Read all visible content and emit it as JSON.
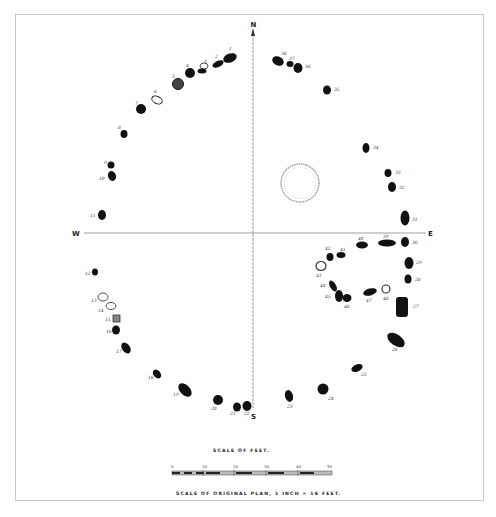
{
  "diagram": {
    "compass": {
      "north": "N",
      "south": "S",
      "east": "E",
      "west": "W"
    },
    "center_feature": "central-ring",
    "stones": [
      {
        "id": "1",
        "x": 230,
        "y": 58
      },
      {
        "id": "2",
        "x": 218,
        "y": 64
      },
      {
        "id": "3",
        "x": 202,
        "y": 70
      },
      {
        "id": "4",
        "x": 190,
        "y": 73
      },
      {
        "id": "5",
        "x": 178,
        "y": 84
      },
      {
        "id": "6",
        "x": 157,
        "y": 100
      },
      {
        "id": "7",
        "x": 141,
        "y": 109
      },
      {
        "id": "8",
        "x": 124,
        "y": 133
      },
      {
        "id": "9",
        "x": 111,
        "y": 164
      },
      {
        "id": "10",
        "x": 112,
        "y": 176
      },
      {
        "id": "11",
        "x": 102,
        "y": 215
      },
      {
        "id": "12",
        "x": 95,
        "y": 272
      },
      {
        "id": "13",
        "x": 98,
        "y": 305
      },
      {
        "id": "14",
        "x": 108,
        "y": 311
      },
      {
        "id": "15",
        "x": 116,
        "y": 318
      },
      {
        "id": "16",
        "x": 116,
        "y": 330
      },
      {
        "id": "17",
        "x": 126,
        "y": 348
      },
      {
        "id": "18",
        "x": 157,
        "y": 374
      },
      {
        "id": "19",
        "x": 185,
        "y": 390
      },
      {
        "id": "20",
        "x": 217,
        "y": 400
      },
      {
        "id": "21",
        "x": 237,
        "y": 407
      },
      {
        "id": "22",
        "x": 247,
        "y": 406
      },
      {
        "id": "23",
        "x": 289,
        "y": 396
      },
      {
        "id": "24",
        "x": 323,
        "y": 389
      },
      {
        "id": "25",
        "x": 357,
        "y": 368
      },
      {
        "id": "26",
        "x": 395,
        "y": 340
      },
      {
        "id": "27",
        "x": 402,
        "y": 307
      },
      {
        "id": "28",
        "x": 409,
        "y": 278
      },
      {
        "id": "29",
        "x": 410,
        "y": 262
      },
      {
        "id": "30",
        "x": 405,
        "y": 242
      },
      {
        "id": "31",
        "x": 405,
        "y": 218
      },
      {
        "id": "32",
        "x": 391,
        "y": 187
      },
      {
        "id": "33",
        "x": 387,
        "y": 173
      },
      {
        "id": "34",
        "x": 366,
        "y": 148
      },
      {
        "id": "35",
        "x": 327,
        "y": 90
      },
      {
        "id": "36",
        "x": 297,
        "y": 67
      },
      {
        "id": "37",
        "x": 289,
        "y": 63
      },
      {
        "id": "38",
        "x": 278,
        "y": 60
      },
      {
        "id": "39",
        "x": 385,
        "y": 243
      },
      {
        "id": "40",
        "x": 361,
        "y": 244
      },
      {
        "id": "41",
        "x": 341,
        "y": 255
      },
      {
        "id": "42",
        "x": 329,
        "y": 257
      },
      {
        "id": "43",
        "x": 321,
        "y": 265
      },
      {
        "id": "44",
        "x": 332,
        "y": 285
      },
      {
        "id": "45",
        "x": 339,
        "y": 297
      },
      {
        "id": "46",
        "x": 347,
        "y": 300
      },
      {
        "id": "47",
        "x": 370,
        "y": 292
      },
      {
        "id": "48",
        "x": 386,
        "y": 290
      }
    ]
  },
  "scale": {
    "title": "SCALE OF FEET.",
    "ticks": [
      "0",
      "10",
      "20",
      "30",
      "40",
      "50"
    ],
    "caption": "SCALE OF ORIGINAL PLAN, 1 INCH = 16 FEET."
  }
}
